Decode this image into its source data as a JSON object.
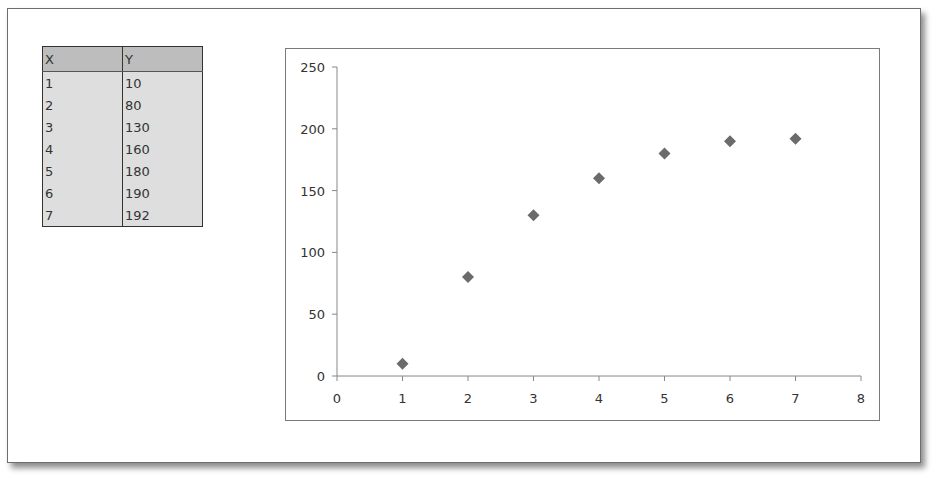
{
  "table": {
    "headers": [
      "X",
      "Y"
    ],
    "rows": [
      [
        "1",
        "10"
      ],
      [
        "2",
        "80"
      ],
      [
        "3",
        "130"
      ],
      [
        "4",
        "160"
      ],
      [
        "5",
        "180"
      ],
      [
        "6",
        "190"
      ],
      [
        "7",
        "192"
      ]
    ]
  },
  "chart_data": {
    "type": "scatter",
    "title": "",
    "xlabel": "",
    "ylabel": "",
    "x": [
      1,
      2,
      3,
      4,
      5,
      6,
      7
    ],
    "y": [
      10,
      80,
      130,
      160,
      180,
      190,
      192
    ],
    "series": [
      {
        "name": "Y",
        "x": [
          1,
          2,
          3,
          4,
          5,
          6,
          7
        ],
        "values": [
          10,
          80,
          130,
          160,
          180,
          190,
          192
        ],
        "marker": "diamond",
        "color": "#6b6b6b"
      }
    ],
    "xlim": [
      0,
      8
    ],
    "ylim": [
      0,
      250
    ],
    "xticks": [
      "0",
      "1",
      "2",
      "3",
      "4",
      "5",
      "6",
      "7",
      "8"
    ],
    "yticks": [
      "0",
      "50",
      "100",
      "150",
      "200",
      "250"
    ],
    "grid": false,
    "legend": "none"
  }
}
